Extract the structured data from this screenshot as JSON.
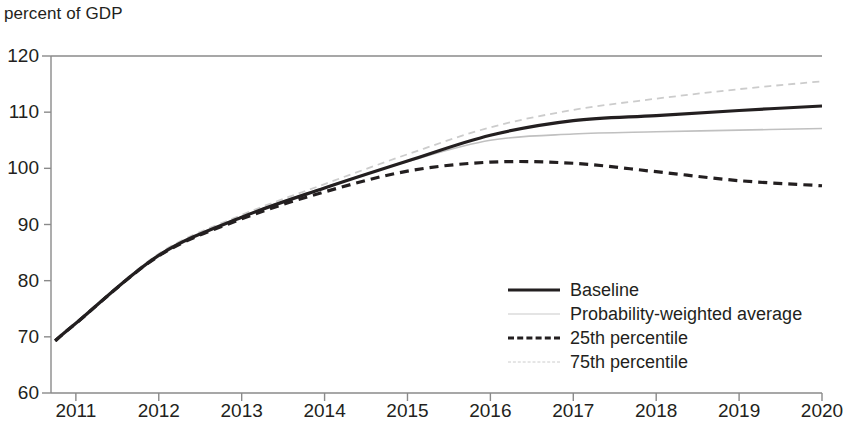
{
  "chart_data": {
    "type": "line",
    "title": "",
    "subtitle": "",
    "ylabel": "percent of GDP",
    "xlabel": "",
    "ylim": [
      60,
      120
    ],
    "xlim": [
      2010.7,
      2020
    ],
    "grid": false,
    "legend_position": "inside-bottom-right",
    "y_ticks": [
      60,
      70,
      80,
      90,
      100,
      110,
      120
    ],
    "x_ticks": [
      2011,
      2012,
      2013,
      2014,
      2015,
      2016,
      2017,
      2018,
      2019,
      2020
    ],
    "x_tick_labels": [
      "2011",
      "2012",
      "2013",
      "2014",
      "2015",
      "2016",
      "2017",
      "2018",
      "2019",
      "2020"
    ],
    "y_tick_labels": [
      "60",
      "70",
      "80",
      "90",
      "100",
      "110",
      "120"
    ],
    "x": [
      2010.75,
      2011,
      2012,
      2013,
      2014,
      2015,
      2016,
      2017,
      2018,
      2019,
      2020
    ],
    "series": [
      {
        "name": "Baseline",
        "style": "solid",
        "color": "#231f20",
        "width": 3.2,
        "values": [
          69.3,
          72.4,
          84.5,
          91.3,
          96.5,
          101.3,
          105.9,
          108.5,
          109.4,
          110.3,
          111.1
        ]
      },
      {
        "name": "Probability-weighted average",
        "style": "solid-light",
        "color": "#c0c0c0",
        "width": 1.6,
        "values": [
          69.3,
          72.4,
          84.6,
          91.4,
          96.6,
          101.2,
          105.0,
          106.1,
          106.5,
          106.8,
          107.1
        ]
      },
      {
        "name": "25th percentile",
        "style": "dashed",
        "color": "#231f20",
        "width": 3.2,
        "values": [
          69.3,
          72.4,
          84.4,
          91.0,
          95.8,
          99.5,
          101.1,
          100.9,
          99.4,
          97.8,
          96.9
        ]
      },
      {
        "name": "75th percentile",
        "style": "dashed-light",
        "color": "#cccccc",
        "width": 1.8,
        "values": [
          69.3,
          72.4,
          84.8,
          91.7,
          97.2,
          102.5,
          107.3,
          110.4,
          112.4,
          114.1,
          115.5
        ]
      }
    ],
    "legend": [
      {
        "label": "Baseline",
        "sample": "solid-dark-line"
      },
      {
        "label": "Probability-weighted average",
        "sample": "solid-light-line"
      },
      {
        "label": "25th percentile",
        "sample": "dashed-dark-line"
      },
      {
        "label": "75th percentile",
        "sample": "dashed-light-line"
      }
    ],
    "axis_color": "#8a8a8a"
  }
}
